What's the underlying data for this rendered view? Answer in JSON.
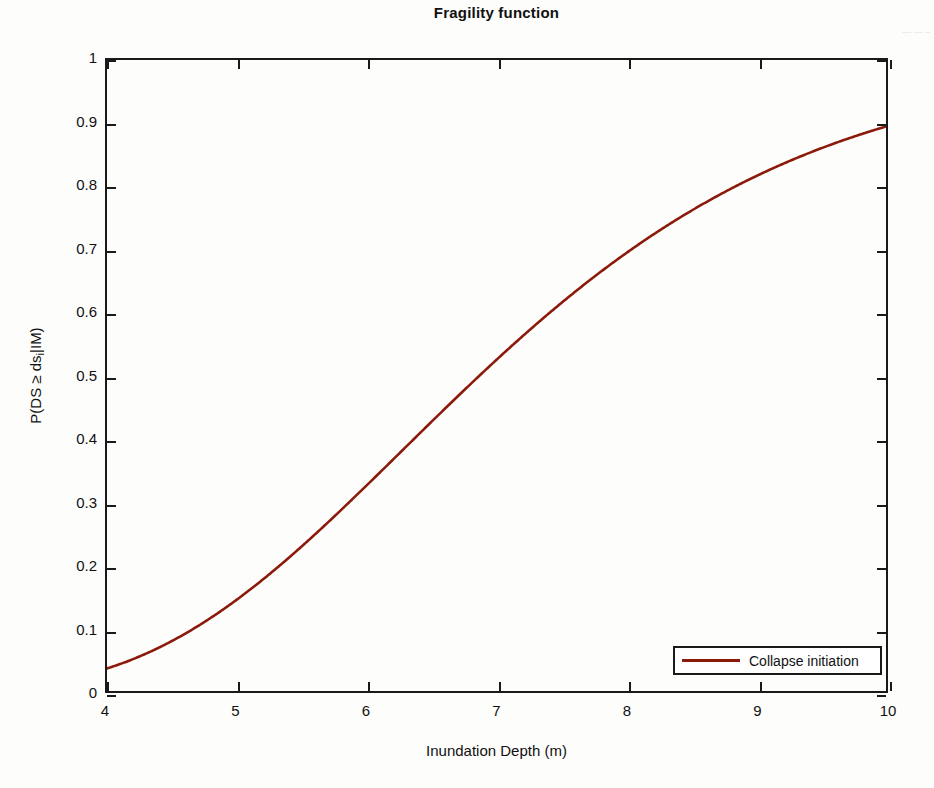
{
  "figure": {
    "title": "Fragility function",
    "background_color": "#fdfdfc",
    "axis_color": "#1a1a1a",
    "curve_color": "#8b1a0a"
  },
  "axes": {
    "x_title": "Inundation Depth (m)",
    "y_title_prefix": "P(DS ≥ ds",
    "y_title_subscript": "i",
    "y_title_suffix": "|IM)",
    "x_ticks": [
      "4",
      "5",
      "6",
      "7",
      "8",
      "9",
      "10"
    ],
    "y_ticks": [
      "1",
      "0.9",
      "0.8",
      "0.7",
      "0.6",
      "0.5",
      "0.4",
      "0.3",
      "0.2",
      "0.1",
      "0"
    ]
  },
  "legend": {
    "position": "bottom-right",
    "entries": [
      {
        "label": "Collapse initiation",
        "color": "#8b1a0a"
      }
    ]
  },
  "margin_marks": "—\n—\n–",
  "chart_data": {
    "type": "line",
    "title": "Fragility function",
    "xlabel": "Inundation Depth (m)",
    "ylabel": "P(DS ≥ ds_i|IM)",
    "xlim": [
      4,
      10
    ],
    "ylim": [
      0,
      1
    ],
    "xticks": [
      4,
      5,
      6,
      7,
      8,
      9,
      10
    ],
    "yticks": [
      0,
      0.1,
      0.2,
      0.3,
      0.4,
      0.5,
      0.6,
      0.7,
      0.8,
      0.9,
      1
    ],
    "grid": false,
    "legend_position": "lower right",
    "curve_model": {
      "family": "lognormal_cdf",
      "median_m": 6.87,
      "beta": 0.3
    },
    "series": [
      {
        "name": "Collapse initiation",
        "color": "#8b1a0a",
        "linewidth": 2.2,
        "x": [
          4.0,
          4.2,
          4.4,
          4.6,
          4.8,
          5.0,
          5.2,
          5.4,
          5.6,
          5.8,
          6.0,
          6.2,
          6.4,
          6.6,
          6.8,
          7.0,
          7.2,
          7.4,
          7.6,
          7.8,
          8.0,
          8.2,
          8.4,
          8.6,
          8.8,
          9.0,
          9.2,
          9.4,
          9.6,
          9.8,
          10.0
        ],
        "y": [
          0.005,
          0.01,
          0.017,
          0.027,
          0.041,
          0.058,
          0.08,
          0.106,
          0.136,
          0.17,
          0.208,
          0.249,
          0.292,
          0.337,
          0.383,
          0.429,
          0.475,
          0.52,
          0.563,
          0.604,
          0.643,
          0.679,
          0.713,
          0.744,
          0.772,
          0.797,
          0.82,
          0.841,
          0.859,
          0.875,
          0.89
        ]
      }
    ]
  }
}
